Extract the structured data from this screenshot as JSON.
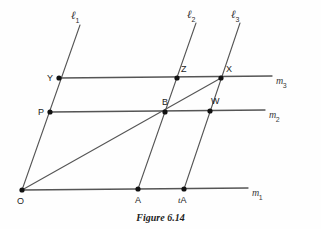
{
  "figure": {
    "caption": "Figure 6.14",
    "caption_y": 212,
    "width": 321,
    "height": 229,
    "stroke_color": "#555555",
    "point_color": "#111111",
    "label_color": "#1c1c1c"
  },
  "points": [
    {
      "id": "O",
      "label": "O",
      "x": 22,
      "y": 190,
      "label_dx": -5,
      "label_dy": 7,
      "italic_prefix": ""
    },
    {
      "id": "A",
      "label": "A",
      "x": 138,
      "y": 189,
      "label_dx": -3,
      "label_dy": 7,
      "italic_prefix": ""
    },
    {
      "id": "tA",
      "label": "A",
      "x": 184,
      "y": 189,
      "label_dx": -6,
      "label_dy": 7,
      "italic_prefix": "t"
    },
    {
      "id": "P",
      "label": "P",
      "x": 50,
      "y": 112,
      "label_dx": -12,
      "label_dy": -4,
      "italic_prefix": ""
    },
    {
      "id": "B",
      "label": "B",
      "x": 165,
      "y": 112,
      "label_dx": -3,
      "label_dy": -14,
      "italic_prefix": ""
    },
    {
      "id": "W",
      "label": "W",
      "x": 210,
      "y": 111,
      "label_dx": 1,
      "label_dy": -14,
      "italic_prefix": ""
    },
    {
      "id": "Y",
      "label": "Y",
      "x": 59,
      "y": 78,
      "label_dx": -12,
      "label_dy": -4,
      "italic_prefix": ""
    },
    {
      "id": "Z",
      "label": "Z",
      "x": 177,
      "y": 78,
      "label_dx": 4,
      "label_dy": -13,
      "italic_prefix": ""
    },
    {
      "id": "X",
      "label": "X",
      "x": 221,
      "y": 78,
      "label_dx": 5,
      "label_dy": -13,
      "italic_prefix": ""
    }
  ],
  "transversals": [
    {
      "id": "l1",
      "base": "ℓ",
      "sub": "1",
      "x1": 80,
      "y1": 25,
      "x2": 22,
      "y2": 190,
      "label_x": 71,
      "label_y": 6
    },
    {
      "id": "l2",
      "base": "ℓ",
      "sub": "2",
      "x1": 196,
      "y1": 23,
      "x2": 138,
      "y2": 189,
      "label_x": 187,
      "label_y": 5
    },
    {
      "id": "l3",
      "base": "ℓ",
      "sub": "3",
      "x1": 240,
      "y1": 23,
      "x2": 184,
      "y2": 189,
      "label_x": 231,
      "label_y": 5
    }
  ],
  "parallels": [
    {
      "id": "m1",
      "base": "m",
      "sub": "1",
      "x1": 22,
      "y1": 190,
      "x2": 248,
      "y2": 188,
      "label_x": 252,
      "label_y": 183
    },
    {
      "id": "m2",
      "base": "m",
      "sub": "2",
      "x1": 50,
      "y1": 112,
      "x2": 265,
      "y2": 110,
      "label_x": 269,
      "label_y": 105
    },
    {
      "id": "m3",
      "base": "m",
      "sub": "3",
      "x1": 59,
      "y1": 78,
      "x2": 272,
      "y2": 76,
      "label_x": 276,
      "label_y": 71
    }
  ],
  "diagonal": {
    "id": "OX",
    "x1": 22,
    "y1": 190,
    "x2": 221,
    "y2": 78
  }
}
